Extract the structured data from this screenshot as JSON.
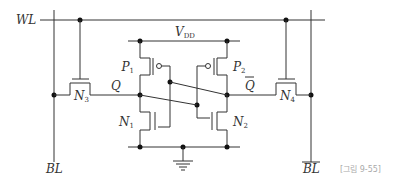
{
  "diagram": {
    "type": "6T SRAM cell schematic",
    "signals": {
      "word_line": "WL",
      "bit_line": "BL",
      "bit_line_bar": "BL",
      "node_q": "Q",
      "node_q_bar": "Q",
      "supply": "V",
      "supply_sub": "DD"
    },
    "transistors": [
      {
        "id": "P1",
        "name": "P",
        "sub": "1",
        "type": "PMOS"
      },
      {
        "id": "P2",
        "name": "P",
        "sub": "2",
        "type": "PMOS"
      },
      {
        "id": "N1",
        "name": "N",
        "sub": "1",
        "type": "NMOS"
      },
      {
        "id": "N2",
        "name": "N",
        "sub": "2",
        "type": "NMOS"
      },
      {
        "id": "N3",
        "name": "N",
        "sub": "3",
        "type": "NMOS access"
      },
      {
        "id": "N4",
        "name": "N",
        "sub": "4",
        "type": "NMOS access"
      }
    ],
    "caption": "[그림 9-55]"
  }
}
